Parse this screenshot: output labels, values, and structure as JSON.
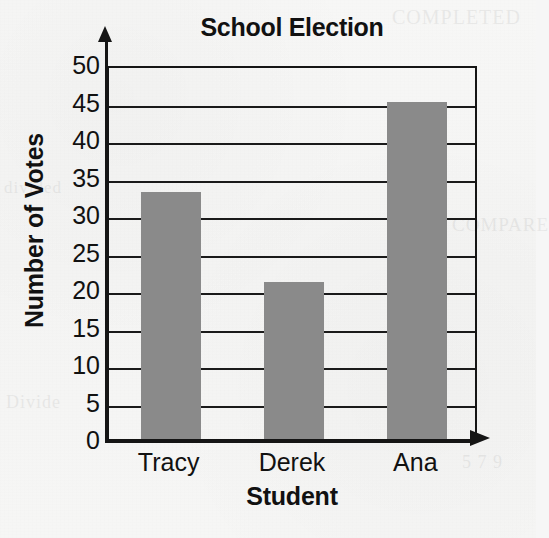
{
  "chart_data": {
    "type": "bar",
    "title": "School Election",
    "xlabel": "Student",
    "ylabel": "Number of Votes",
    "categories": [
      "Tracy",
      "Derek",
      "Ana"
    ],
    "values": [
      33,
      21,
      45
    ],
    "ylim": [
      0,
      50
    ],
    "ytick_step": 5,
    "yticks": [
      0,
      5,
      10,
      15,
      20,
      25,
      30,
      35,
      40,
      45,
      50
    ],
    "ytick_labels": [
      "0",
      "5",
      "10",
      "15",
      "20",
      "25",
      "30",
      "35",
      "40",
      "45",
      "50"
    ],
    "grid": "horizontal",
    "legend": "none",
    "bar_color": "#8a8a8a",
    "axis_color": "#151515",
    "background_color": "#f6f6f5"
  },
  "chart": {
    "title": "School Election",
    "x_axis_title": "Student",
    "y_axis_title": "Number of Votes",
    "y_ticks": [
      {
        "value": 50,
        "label": "50"
      },
      {
        "value": 45,
        "label": "45"
      },
      {
        "value": 40,
        "label": "40"
      },
      {
        "value": 35,
        "label": "35"
      },
      {
        "value": 30,
        "label": "30"
      },
      {
        "value": 25,
        "label": "25"
      },
      {
        "value": 20,
        "label": "20"
      },
      {
        "value": 15,
        "label": "15"
      },
      {
        "value": 10,
        "label": "10"
      },
      {
        "value": 5,
        "label": "5"
      },
      {
        "value": 0,
        "label": "0"
      }
    ],
    "bars": [
      {
        "label": "Tracy",
        "value": 33
      },
      {
        "label": "Derek",
        "value": 21
      },
      {
        "label": "Ana",
        "value": 45
      }
    ]
  },
  "bleed_text": {
    "top_right": "COMPLETED",
    "mid_left": "divided",
    "mid_right": "COMPARE",
    "bottom_left": "Divide",
    "bottom_right": "5 7 9"
  }
}
